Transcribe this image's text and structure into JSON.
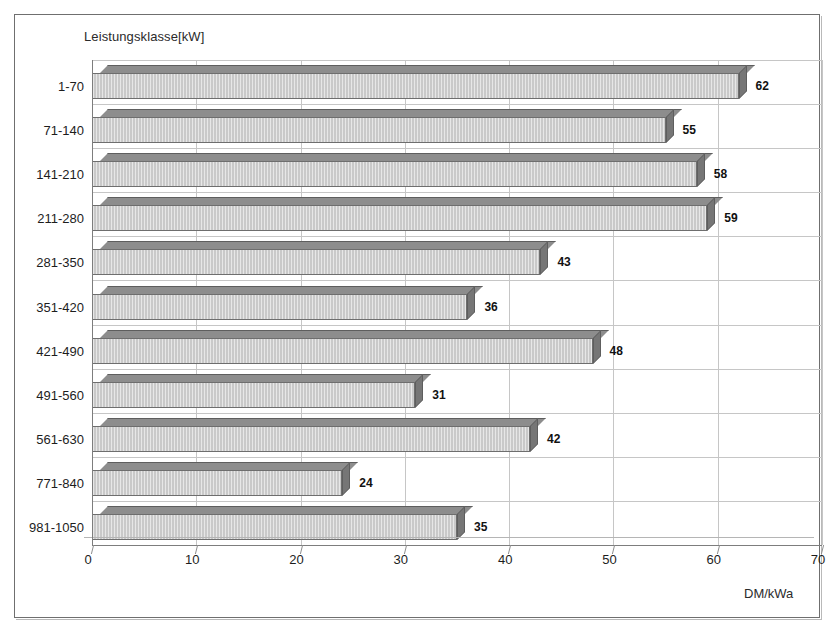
{
  "chart_data": {
    "type": "bar",
    "orientation": "horizontal",
    "title": "",
    "ylabel": "Leistungsklasse[kW]",
    "xlabel": "DM/kWa",
    "categories": [
      "1-70",
      "71-140",
      "141-210",
      "211-280",
      "281-350",
      "351-420",
      "421-490",
      "491-560",
      "561-630",
      "771-840",
      "981-1050"
    ],
    "values": [
      62,
      55,
      58,
      59,
      43,
      36,
      48,
      31,
      42,
      24,
      35
    ],
    "xlim": [
      0,
      70
    ],
    "xticks": [
      0,
      10,
      20,
      30,
      40,
      50,
      60,
      70
    ],
    "xticklabels": [
      "0",
      "10",
      "20",
      "30",
      "40",
      "50",
      "60",
      "70"
    ],
    "grid": true,
    "legend": false,
    "data_labels": true,
    "style": "3d-bar",
    "colors": {
      "bar_front": "#c9c9c9",
      "bar_top": "#8d8d8d",
      "bar_side": "#767676",
      "bar_edge": "#6e6e6e",
      "gridline": "#c6c6c6",
      "axis": "#7d7d7d",
      "text": "#1d1d1d",
      "background": "#ffffff",
      "frame": "#6f6f6f"
    }
  }
}
